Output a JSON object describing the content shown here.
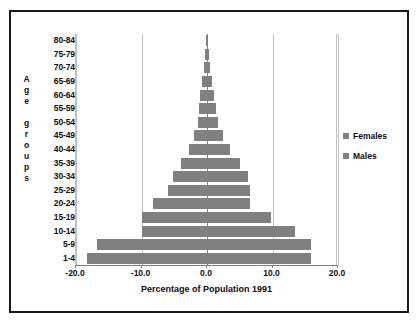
{
  "chart_data": {
    "type": "bar",
    "subtype": "population-pyramid",
    "title": "",
    "xlabel": "Percentage of Population 1991",
    "ylabel": "Age groups",
    "xlim": [
      -20.0,
      20.0
    ],
    "xticks": [
      "-20.0",
      "-10.0",
      "0.0",
      "10.0",
      "20.0"
    ],
    "xtick_values": [
      -20.0,
      -10.0,
      0.0,
      10.0,
      20.0
    ],
    "grid": true,
    "legend_position": "right",
    "bar_color": "#808080",
    "grid_color": "#bfbfbf",
    "axis_color": "#7f7f7f",
    "frame_color": "#1a1a1a",
    "categories": [
      "80-84",
      "75-79",
      "70-74",
      "65-69",
      "60-64",
      "55-59",
      "50-54",
      "45-49",
      "40-44",
      "35-39",
      "30-34",
      "25-29",
      "20-24",
      "15-19",
      "10-14",
      "5-9",
      "1-4"
    ],
    "series": [
      {
        "name": "Males",
        "side": "left",
        "values": [
          -0.15,
          -0.25,
          -0.4,
          -0.7,
          -1.0,
          -1.2,
          -1.4,
          -2.0,
          -2.8,
          -4.0,
          -5.2,
          -6.0,
          -8.2,
          -10.0,
          -10.0,
          -16.8,
          -18.3
        ]
      },
      {
        "name": "Females",
        "side": "right",
        "values": [
          0.15,
          0.3,
          0.5,
          0.8,
          1.1,
          1.4,
          1.7,
          2.4,
          3.5,
          5.0,
          6.2,
          6.6,
          6.6,
          9.8,
          13.4,
          15.9,
          15.9
        ]
      }
    ]
  },
  "legend": {
    "items": [
      {
        "label": "Females",
        "color": "#808080",
        "swatch_icon": "square-swatch-icon"
      },
      {
        "label": "Males",
        "color": "#808080",
        "swatch_icon": "square-swatch-icon"
      }
    ]
  },
  "yaxis_title_chars": [
    "A",
    "g",
    "e",
    "",
    "g",
    "r",
    "o",
    "u",
    "p",
    "s"
  ]
}
